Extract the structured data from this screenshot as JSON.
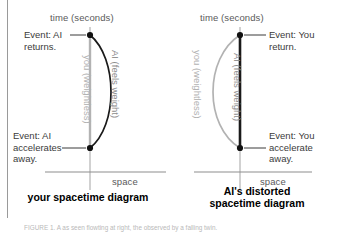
{
  "figure": {
    "caption": "FIGURE 1. A as seen flowting at right, the observed by a falling twin."
  },
  "panels": [
    {
      "id": "your-spacetime-diagram",
      "title": "your spacetime diagram",
      "title_lines": [
        "your spacetime diagram"
      ],
      "time_axis_label": "time (seconds)",
      "space_axis_label": "space",
      "events": [
        {
          "id": "event-top",
          "text_lines": [
            "Event: AI",
            "returns."
          ]
        },
        {
          "id": "event-bottom",
          "text_lines": [
            "Event: AI",
            "accelerates",
            "away."
          ]
        }
      ],
      "worldlines": [
        {
          "id": "you-worldline",
          "label": "you (weightless)",
          "shape": "straight",
          "color": "#b2b2b2"
        },
        {
          "id": "ai-worldline",
          "label": "AI (feels weight)",
          "shape": "curved-right",
          "color": "#1a1a1a"
        }
      ]
    },
    {
      "id": "ai-distorted-spacetime-diagram",
      "title": "AI's distorted spacetime diagram",
      "title_lines": [
        "AI's distorted",
        "spacetime diagram"
      ],
      "time_axis_label": "time (seconds)",
      "space_axis_label": "space",
      "events": [
        {
          "id": "event-top",
          "text_lines": [
            "Event: You",
            "return."
          ]
        },
        {
          "id": "event-bottom",
          "text_lines": [
            "Event: You",
            "accelerate",
            "away."
          ]
        }
      ],
      "worldlines": [
        {
          "id": "you-worldline",
          "label": "you (weightless)",
          "shape": "curved-left",
          "color": "#b2b2b2"
        },
        {
          "id": "ai-worldline",
          "label": "AI (feels weight)",
          "shape": "straight",
          "color": "#1a1a1a"
        }
      ]
    }
  ],
  "colors": {
    "ink": "#1a1a1a",
    "gray_line": "#b2b2b2",
    "axis_gray": "#8d8d8d",
    "label_gray": "#5a5a5a",
    "background": "#ffffff"
  }
}
